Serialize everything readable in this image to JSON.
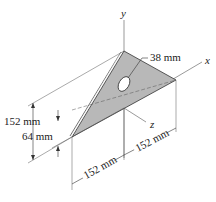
{
  "diagram": {
    "type": "engineering-drawing",
    "axes": {
      "x": "x",
      "y": "y",
      "z": "z"
    },
    "dimensions": {
      "hole_diameter": "38 mm",
      "height_total": "152 mm",
      "height_lower": "64 mm",
      "width_left": "152 mm",
      "width_right": "152 mm"
    },
    "colors": {
      "plate_fill": "#b8b8b8",
      "line": "#333333",
      "background": "#ffffff"
    }
  }
}
